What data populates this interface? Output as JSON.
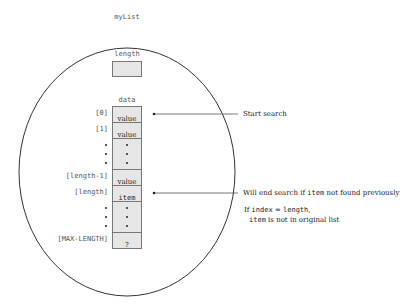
{
  "diagram": {
    "object_name": "myList",
    "length_field": {
      "label": "length"
    },
    "data_field": {
      "label": "data",
      "cells": [
        {
          "index": "[0]",
          "content": "value"
        },
        {
          "index": "[1]",
          "content": "value"
        },
        {
          "index": "",
          "content": "",
          "ellipsis": true
        },
        {
          "index": "[length-1]",
          "content": "value"
        },
        {
          "index": "[length]",
          "content": "item"
        },
        {
          "index": "",
          "content": "",
          "ellipsis": true
        },
        {
          "index": "[MAX-LENGTH]",
          "content": "?"
        }
      ]
    },
    "annotations": {
      "start": "Start search",
      "end_pre": "Will end search if ",
      "end_code": "item",
      "end_post": " not found previously",
      "cond_pre": "If ",
      "cond_code1": "index",
      "cond_mid": " = ",
      "cond_code2": "length",
      "cond_comma": ",",
      "cond2_code": "item",
      "cond2_text": " is not in original list"
    }
  }
}
